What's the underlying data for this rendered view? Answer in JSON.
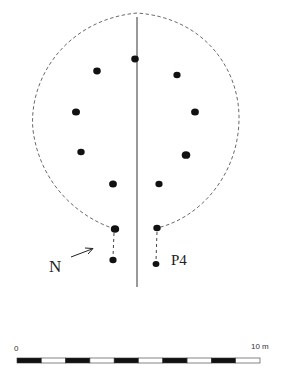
{
  "figure": {
    "type": "archaeological-site-plan",
    "colors": {
      "outline": "#6a6a6a",
      "post": "#111111",
      "axis": "#555555",
      "text": "#222222"
    }
  },
  "outline": {
    "style": "dashed",
    "shape": "oval-house-plan"
  },
  "axis_line": {
    "x": 137,
    "y1": 17,
    "y2": 287
  },
  "posts": [
    {
      "x": 135,
      "y": 59,
      "r": 3.8
    },
    {
      "x": 97,
      "y": 71,
      "r": 3.8
    },
    {
      "x": 177,
      "y": 75,
      "r": 3.6
    },
    {
      "x": 76,
      "y": 112,
      "r": 4.0
    },
    {
      "x": 195,
      "y": 112,
      "r": 3.9
    },
    {
      "x": 81,
      "y": 152,
      "r": 3.7
    },
    {
      "x": 186,
      "y": 155,
      "r": 4.3
    },
    {
      "x": 113,
      "y": 184,
      "r": 3.9
    },
    {
      "x": 159,
      "y": 184,
      "r": 3.6
    }
  ],
  "entrance_posts": {
    "left": {
      "outer": {
        "x": 115,
        "y": 229,
        "r": 4.2
      },
      "inner": {
        "x": 113,
        "y": 260,
        "r": 3.6
      }
    },
    "right": {
      "outer": {
        "x": 157,
        "y": 228,
        "r": 3.7
      },
      "inner": {
        "x": 156,
        "y": 264,
        "r": 3.4
      }
    }
  },
  "labels": {
    "north": "N",
    "post_label": "P4"
  },
  "scale_bar": {
    "start_label": "0",
    "end_label": "10 m",
    "segments": 10,
    "x_start": 17,
    "x_end": 260
  }
}
